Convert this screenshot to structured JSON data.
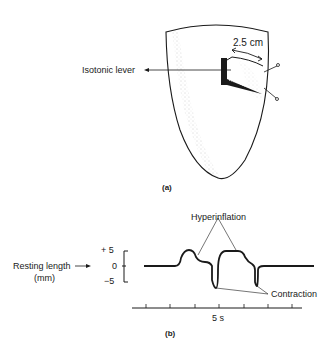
{
  "panel_a": {
    "label": "(a)",
    "lever_label": "Isotonic lever",
    "distance_label": "2.5 cm"
  },
  "panel_b": {
    "label": "(b)",
    "y_axis_label_line1": "Resting length",
    "y_axis_label_line2": "(mm)",
    "y_ticks": [
      "+ 5",
      "0",
      "−5"
    ],
    "time_label": "5 s",
    "annotation_hyperinflation": "Hyperinflation",
    "annotation_contraction": "Contraction"
  },
  "colors": {
    "ink": "#1a1a1a",
    "stipple": "#8a8a8a"
  }
}
